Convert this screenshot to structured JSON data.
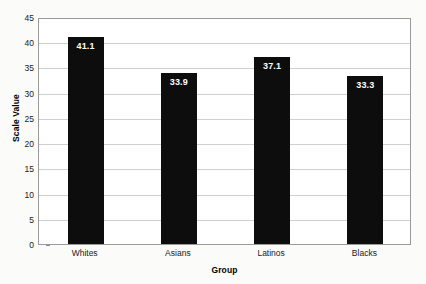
{
  "chart_data": {
    "type": "bar",
    "title": "",
    "subtitle": "",
    "xlabel": "Group",
    "ylabel": "Scale Value",
    "categories": [
      "Whites",
      "Asians",
      "Latinos",
      "Blacks"
    ],
    "values": [
      41.1,
      33.9,
      37.1,
      33.3
    ],
    "value_labels": [
      "41.1",
      "33.9",
      "37.1",
      "33.3"
    ],
    "series": [
      {
        "name": "Scale Value",
        "values": [
          41.1,
          33.9,
          37.1,
          33.3
        ],
        "color": "#0d0d0d"
      }
    ],
    "ylim": [
      0,
      45
    ],
    "ytick_step": 5,
    "yticks": [
      0,
      5,
      10,
      15,
      20,
      25,
      30,
      35,
      40,
      45
    ],
    "ytick_labels": [
      "0",
      "5",
      "10",
      "15",
      "20",
      "25",
      "30",
      "35",
      "40",
      "45"
    ],
    "grid": true,
    "grid_axis": "y",
    "legend": false,
    "legend_position": "none",
    "bar_color": "#0d0d0d",
    "value_label_color": "#ffffff",
    "plot_background": "#ffffff",
    "figure_background": "#fbfbf9",
    "grid_color": "#cfcfcf",
    "axis_color": "#9a9a9a"
  }
}
